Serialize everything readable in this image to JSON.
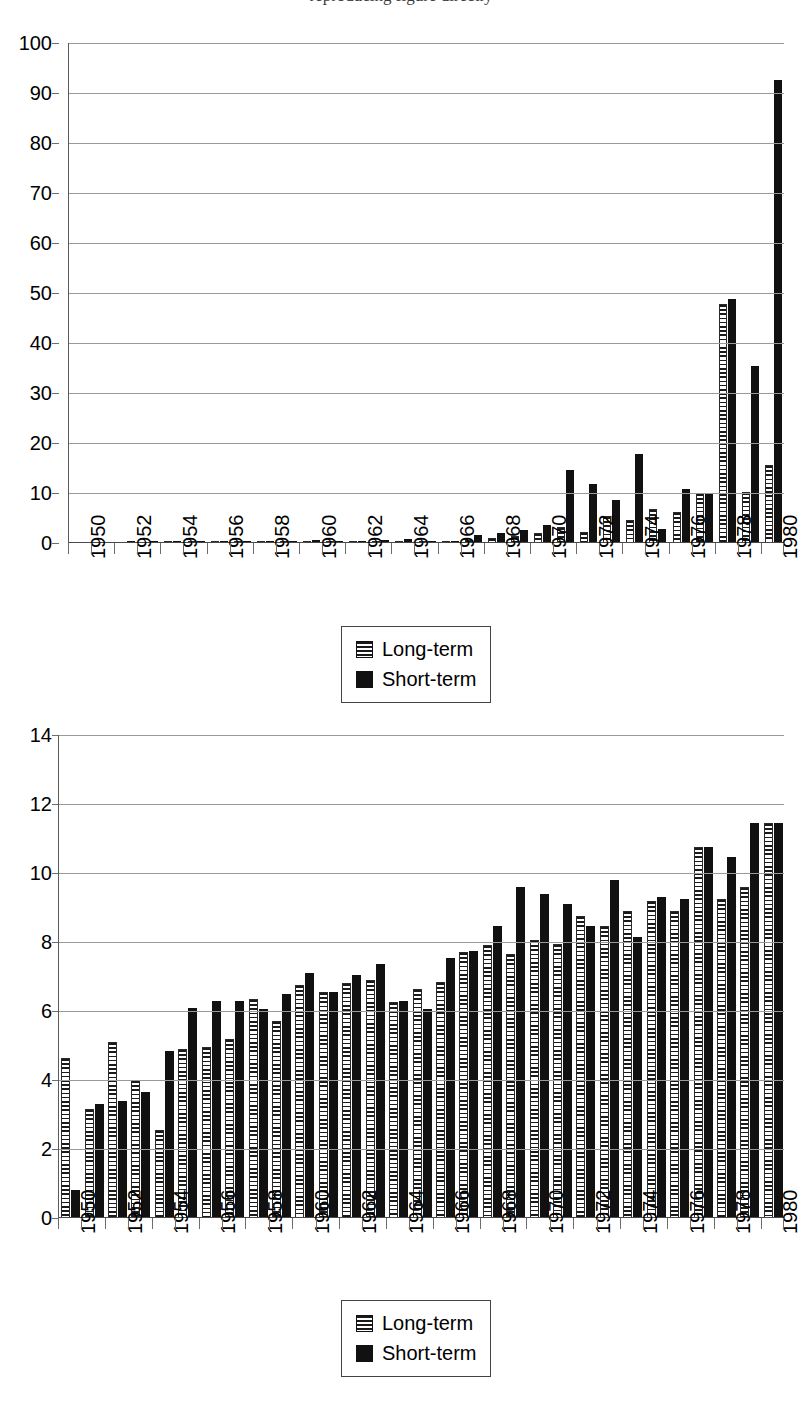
{
  "page": {
    "cut_off_header": "reproducing figure directly"
  },
  "legend": {
    "long_label": "Long-term",
    "short_label": "Short-term"
  },
  "colors": {
    "short_term": "#111111",
    "long_term_stripe": "#1a1a1a",
    "gridline": "#9a9a9a",
    "axis": "#5a5a5a",
    "background": "#ffffff"
  },
  "chart_data": [
    {
      "id": "chart-top",
      "type": "bar",
      "title": "",
      "xlabel": "",
      "ylabel": "",
      "ylim": [
        0,
        100
      ],
      "yticks": [
        0,
        10,
        20,
        30,
        40,
        50,
        60,
        70,
        80,
        90,
        100
      ],
      "ytick_labels": [
        "0",
        "10",
        "20",
        "30",
        "40",
        "50",
        "60",
        "70",
        "80",
        "90",
        "100"
      ],
      "grid": true,
      "legend_position": "bottom-center",
      "categories": [
        1950,
        1951,
        1952,
        1953,
        1954,
        1955,
        1956,
        1957,
        1958,
        1959,
        1960,
        1961,
        1962,
        1963,
        1964,
        1965,
        1966,
        1967,
        1968,
        1969,
        1970,
        1971,
        1972,
        1973,
        1974,
        1975,
        1976,
        1977,
        1978,
        1979,
        1980
      ],
      "tick_labels": [
        "1950",
        "",
        "1952",
        "",
        "1954",
        "",
        "1956",
        "",
        "1958",
        "",
        "1960",
        "",
        "1962",
        "",
        "1964",
        "",
        "1966",
        "",
        "1968",
        "",
        "1970",
        "",
        "1972",
        "",
        "1974",
        "",
        "1976",
        "",
        "1978",
        "",
        "1980"
      ],
      "series": [
        {
          "name": "Long-term",
          "values": [
            0.0,
            0.0,
            0.05,
            0.05,
            0.1,
            0.15,
            0.2,
            0.2,
            0.2,
            0.25,
            0.3,
            0.3,
            0.3,
            0.35,
            0.4,
            0.3,
            0.2,
            0.6,
            1.0,
            1.4,
            2.0,
            3.2,
            2.3,
            5.5,
            4.6,
            6.9,
            6.3,
            10.0,
            47.8,
            10.3,
            15.6
          ]
        },
        {
          "name": "Short-term",
          "values": [
            0.0,
            0.0,
            0.1,
            0.1,
            0.15,
            0.4,
            0.4,
            0.3,
            0.3,
            0.5,
            0.6,
            0.5,
            0.5,
            0.6,
            0.9,
            0.5,
            0.3,
            1.6,
            2.1,
            2.6,
            3.6,
            14.7,
            11.9,
            8.7,
            17.9,
            2.9,
            10.9,
            10.0,
            48.8,
            35.4,
            92.7
          ]
        }
      ]
    },
    {
      "id": "chart-bottom",
      "type": "bar",
      "title": "",
      "xlabel": "",
      "ylabel": "",
      "ylim": [
        0,
        14
      ],
      "yticks": [
        0,
        2,
        4,
        6,
        8,
        10,
        12,
        14
      ],
      "ytick_labels": [
        "0",
        "2",
        "4",
        "6",
        "8",
        "10",
        "12",
        "14"
      ],
      "grid": true,
      "legend_position": "bottom-center",
      "categories": [
        1950,
        1951,
        1952,
        1953,
        1954,
        1955,
        1956,
        1957,
        1958,
        1959,
        1960,
        1961,
        1962,
        1963,
        1964,
        1965,
        1966,
        1967,
        1968,
        1969,
        1970,
        1971,
        1972,
        1973,
        1974,
        1975,
        1976,
        1977,
        1978,
        1979,
        1980
      ],
      "tick_labels": [
        "1950",
        "",
        "1952",
        "",
        "1954",
        "",
        "1956",
        "",
        "1958",
        "",
        "1960",
        "",
        "1962",
        "",
        "1964",
        "",
        "1966",
        "",
        "1968",
        "",
        "1970",
        "",
        "1972",
        "",
        "1974",
        "",
        "1976",
        "",
        "1978",
        "",
        "1980"
      ],
      "series": [
        {
          "name": "Long-term",
          "values": [
            4.65,
            3.15,
            5.1,
            4.0,
            2.55,
            4.9,
            4.95,
            5.2,
            6.35,
            5.7,
            6.75,
            6.55,
            6.8,
            6.9,
            6.25,
            6.65,
            6.85,
            7.7,
            7.9,
            7.65,
            8.05,
            7.95,
            8.75,
            8.45,
            8.9,
            9.2,
            8.9,
            10.75,
            9.25,
            9.6,
            11.45
          ]
        },
        {
          "name": "Short-term",
          "values": [
            0.8,
            3.3,
            3.4,
            3.65,
            4.85,
            6.1,
            6.3,
            6.3,
            6.05,
            6.5,
            7.1,
            6.55,
            7.05,
            7.35,
            6.3,
            6.05,
            7.55,
            7.75,
            8.45,
            9.6,
            9.4,
            9.1,
            8.45,
            9.8,
            8.15,
            9.3,
            9.25,
            10.75,
            10.45,
            11.45,
            11.45
          ]
        }
      ]
    }
  ]
}
